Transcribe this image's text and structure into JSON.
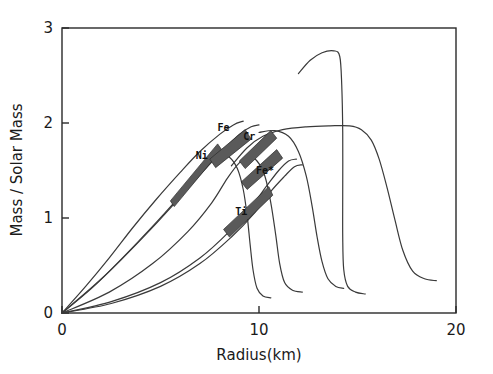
{
  "chart_data": {
    "type": "line",
    "title": "",
    "xlabel": "Radius(km)",
    "ylabel": "Mass / Solar Mass",
    "xlim": [
      0,
      20
    ],
    "ylim": [
      0,
      3
    ],
    "xticks": [
      0,
      10,
      20
    ],
    "xtick_labels": [
      "0",
      "10",
      "20"
    ],
    "yticks": [
      0,
      1,
      2,
      3
    ],
    "ytick_labels": [
      "0",
      "1",
      "2",
      "3"
    ],
    "grid": false,
    "legend": "none",
    "annotations": [
      {
        "label": "Ni",
        "x": 7.1,
        "y": 1.62
      },
      {
        "label": "Fe",
        "x": 8.2,
        "y": 1.92
      },
      {
        "label": "Cr",
        "x": 9.5,
        "y": 1.82
      },
      {
        "label": "Fe*",
        "x": 10.3,
        "y": 1.46
      },
      {
        "label": "Ti",
        "x": 9.1,
        "y": 1.03
      }
    ],
    "bands": [
      {
        "name": "Ni",
        "points": [
          [
            5.5,
            1.18
          ],
          [
            7.9,
            1.78
          ],
          [
            8.1,
            1.72
          ],
          [
            5.7,
            1.12
          ]
        ]
      },
      {
        "name": "Fe",
        "points": [
          [
            7.5,
            1.62
          ],
          [
            9.3,
            1.93
          ],
          [
            9.6,
            1.83
          ],
          [
            7.8,
            1.53
          ]
        ]
      },
      {
        "name": "Cr",
        "points": [
          [
            9.0,
            1.6
          ],
          [
            10.6,
            1.92
          ],
          [
            10.9,
            1.84
          ],
          [
            9.3,
            1.52
          ]
        ]
      },
      {
        "name": "Fe*",
        "points": [
          [
            9.1,
            1.38
          ],
          [
            10.9,
            1.72
          ],
          [
            11.2,
            1.63
          ],
          [
            9.4,
            1.3
          ]
        ]
      },
      {
        "name": "Ti",
        "points": [
          [
            8.2,
            0.88
          ],
          [
            10.5,
            1.33
          ],
          [
            10.7,
            1.24
          ],
          [
            8.5,
            0.8
          ]
        ]
      }
    ],
    "series": [
      {
        "name": "curve-a-rising-steep",
        "comment": "steep inner rise to Ni/Fe peak",
        "points": [
          [
            0,
            0
          ],
          [
            1.2,
            0.28
          ],
          [
            2.4,
            0.58
          ],
          [
            3.6,
            0.9
          ],
          [
            4.8,
            1.2
          ],
          [
            6.0,
            1.48
          ],
          [
            7.0,
            1.7
          ],
          [
            8.0,
            1.88
          ],
          [
            8.7,
            1.98
          ],
          [
            9.2,
            2.02
          ]
        ]
      },
      {
        "name": "curve-b-rising",
        "comment": "second rising branch",
        "points": [
          [
            0,
            0
          ],
          [
            1.5,
            0.26
          ],
          [
            3.0,
            0.56
          ],
          [
            4.5,
            0.88
          ],
          [
            6.0,
            1.22
          ],
          [
            7.2,
            1.5
          ],
          [
            8.2,
            1.72
          ],
          [
            9.0,
            1.88
          ],
          [
            9.6,
            1.96
          ],
          [
            10.0,
            1.98
          ]
        ]
      },
      {
        "name": "curve-c-peak-fall-left",
        "comment": "peak ~1.65 then sharp fall to 10 km",
        "points": [
          [
            0,
            0
          ],
          [
            2.0,
            0.36
          ],
          [
            4.0,
            0.78
          ],
          [
            5.6,
            1.14
          ],
          [
            6.8,
            1.44
          ],
          [
            7.6,
            1.6
          ],
          [
            8.1,
            1.66
          ],
          [
            8.5,
            1.64
          ],
          [
            8.9,
            1.52
          ],
          [
            9.2,
            1.3
          ],
          [
            9.4,
            1.02
          ],
          [
            9.55,
            0.72
          ],
          [
            9.7,
            0.45
          ],
          [
            9.9,
            0.26
          ],
          [
            10.2,
            0.18
          ],
          [
            10.6,
            0.16
          ]
        ]
      },
      {
        "name": "curve-d-shoulder",
        "comment": "shoulder branch falling near 10.5 km",
        "points": [
          [
            0,
            0
          ],
          [
            2.4,
            0.22
          ],
          [
            4.6,
            0.52
          ],
          [
            6.4,
            0.86
          ],
          [
            7.6,
            1.16
          ],
          [
            8.4,
            1.42
          ],
          [
            9.0,
            1.58
          ],
          [
            9.5,
            1.64
          ],
          [
            9.9,
            1.6
          ],
          [
            10.3,
            1.44
          ],
          [
            10.6,
            1.16
          ],
          [
            10.85,
            0.82
          ],
          [
            11.05,
            0.52
          ],
          [
            11.3,
            0.32
          ],
          [
            11.7,
            0.24
          ],
          [
            12.2,
            0.22
          ]
        ]
      },
      {
        "name": "curve-e-lower-slow",
        "comment": "slowly rising lower envelope",
        "points": [
          [
            0,
            0
          ],
          [
            2.5,
            0.12
          ],
          [
            5.0,
            0.32
          ],
          [
            7.0,
            0.58
          ],
          [
            8.5,
            0.86
          ],
          [
            9.6,
            1.12
          ],
          [
            10.4,
            1.34
          ],
          [
            11.0,
            1.5
          ],
          [
            11.5,
            1.6
          ],
          [
            11.9,
            1.62
          ]
        ]
      },
      {
        "name": "curve-f-lower-slow-2",
        "comment": "companion lower envelope",
        "points": [
          [
            0,
            0
          ],
          [
            2.5,
            0.1
          ],
          [
            5.0,
            0.28
          ],
          [
            7.0,
            0.52
          ],
          [
            8.6,
            0.8
          ],
          [
            9.8,
            1.06
          ],
          [
            10.6,
            1.28
          ],
          [
            11.3,
            1.44
          ],
          [
            11.8,
            1.54
          ],
          [
            12.2,
            1.56
          ]
        ]
      },
      {
        "name": "curve-g-plateau-2sm",
        "comment": "broad plateau near 1.97 solar masses falling after 15 km",
        "points": [
          [
            8.6,
            1.55
          ],
          [
            9.4,
            1.74
          ],
          [
            10.2,
            1.86
          ],
          [
            11.2,
            1.93
          ],
          [
            12.4,
            1.96
          ],
          [
            13.6,
            1.97
          ],
          [
            14.6,
            1.97
          ],
          [
            15.2,
            1.93
          ],
          [
            15.7,
            1.82
          ],
          [
            16.1,
            1.62
          ],
          [
            16.5,
            1.32
          ],
          [
            16.9,
            0.98
          ],
          [
            17.3,
            0.66
          ],
          [
            17.8,
            0.44
          ],
          [
            18.4,
            0.36
          ],
          [
            19.0,
            0.34
          ]
        ]
      },
      {
        "name": "curve-h-tall-peak",
        "comment": "tall branch peaking ~2.75 then vertical drop at 14.2 km",
        "points": [
          [
            12.0,
            2.52
          ],
          [
            12.6,
            2.66
          ],
          [
            13.2,
            2.74
          ],
          [
            13.8,
            2.76
          ],
          [
            14.1,
            2.7
          ],
          [
            14.2,
            2.4
          ],
          [
            14.25,
            1.9
          ],
          [
            14.25,
            1.3
          ],
          [
            14.25,
            0.8
          ],
          [
            14.3,
            0.46
          ],
          [
            14.5,
            0.28
          ],
          [
            14.9,
            0.22
          ],
          [
            15.4,
            0.2
          ]
        ]
      },
      {
        "name": "curve-i-mid-fall",
        "comment": "mid branch falling from plateau near 12 km",
        "points": [
          [
            10.0,
            1.9
          ],
          [
            10.8,
            1.92
          ],
          [
            11.5,
            1.86
          ],
          [
            12.0,
            1.7
          ],
          [
            12.4,
            1.44
          ],
          [
            12.7,
            1.12
          ],
          [
            12.95,
            0.8
          ],
          [
            13.2,
            0.54
          ],
          [
            13.5,
            0.36
          ],
          [
            13.9,
            0.28
          ],
          [
            14.3,
            0.26
          ]
        ]
      }
    ]
  },
  "figure": {
    "background_color": "#ffffff",
    "axis_color": "#2a2a2a",
    "curve_color": "#3a3a3a",
    "band_fill_color": "#5a5a5a"
  }
}
